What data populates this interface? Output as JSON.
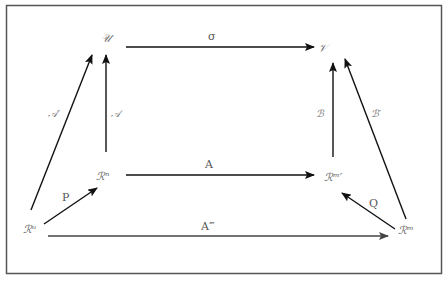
{
  "diagram": {
    "frame_color": "#555555",
    "arrow_color": "#111111",
    "label_color": "#6a6a6a",
    "nodes": {
      "U": "𝒰",
      "V": "𝒱",
      "Rn": "ℛⁿ",
      "Rm_prime": "ℛᵐ′",
      "Ru": "ℛᵘ",
      "Rm": "ℛᵐ"
    },
    "edges": {
      "sigma": "σ",
      "A_script": "𝒜",
      "A_script_prime": "𝒜′",
      "B_script": "ℬ",
      "B_script_prime": "ℬ′",
      "A": "A",
      "P": "P",
      "Q": "Q",
      "A_triple_prime": "A‴"
    }
  }
}
